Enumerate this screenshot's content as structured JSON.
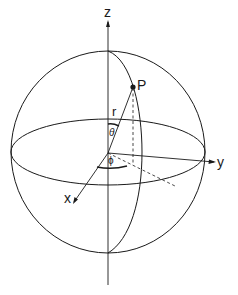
{
  "diagram": {
    "labels": {
      "z_axis": "z",
      "y_axis": "y",
      "x_axis": "x",
      "point": "P",
      "radius": "r",
      "polar_angle": "θ",
      "azimuth_angle": "ϕ"
    },
    "colors": {
      "stroke": "#1a1a1a",
      "background": "#ffffff"
    },
    "geometry": {
      "origin": [
        108,
        153
      ],
      "sphere": {
        "cx": 108,
        "cy": 152,
        "rx": 97,
        "ry": 101
      },
      "equator": {
        "cx": 108,
        "cy": 152,
        "rx": 97,
        "ry": 33
      },
      "point_P": [
        133,
        87
      ]
    }
  }
}
